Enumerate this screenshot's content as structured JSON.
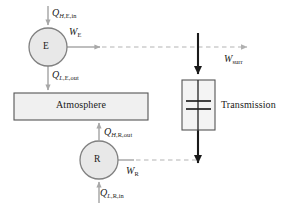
{
  "diagram": {
    "type": "thermodynamic-cycle-schematic",
    "width": 291,
    "height": 211,
    "background_color": "#ffffff",
    "colors": {
      "node_fill": "#e8e8e8",
      "node_stroke": "#808080",
      "box_fill": "#f0f0f0",
      "box_stroke": "#555555",
      "gray_arrow": "#a8a8a8",
      "dashed_line": "#b4b4b4",
      "black_shaft": "#1a1a1a",
      "text": "#1a1a1a"
    },
    "nodes": [
      {
        "id": "engine",
        "label": "E",
        "shape": "circle",
        "cx": 48,
        "cy": 47,
        "r": 19
      },
      {
        "id": "refrigerator",
        "label": "R",
        "shape": "circle",
        "cx": 99,
        "cy": 160,
        "r": 19
      }
    ],
    "boxes": [
      {
        "id": "atmosphere",
        "label": "Atmosphere",
        "x": 14,
        "y": 93,
        "width": 134,
        "height": 27
      },
      {
        "id": "transmission",
        "label": "Transmission",
        "x": 182,
        "y": 80,
        "width": 33,
        "height": 50
      }
    ],
    "labels": {
      "q_h_e_in": {
        "symbol": "Q",
        "sub_italic": "H",
        "sub_rest": ",E,in",
        "full": "Q_H,E,in"
      },
      "w_e": {
        "symbol": "W",
        "sub_italic": "",
        "sub_rest": "E",
        "full": "W_E"
      },
      "q_l_e_out": {
        "symbol": "Q",
        "sub_italic": "L",
        "sub_rest": ",E,out",
        "full": "Q_L,E,out"
      },
      "q_h_r_out": {
        "symbol": "Q",
        "sub_italic": "H",
        "sub_rest": ",R,out",
        "full": "Q_H,R,out"
      },
      "w_r": {
        "symbol": "W",
        "sub_italic": "",
        "sub_rest": "R",
        "full": "W_R"
      },
      "q_l_r_in": {
        "symbol": "Q",
        "sub_italic": "L",
        "sub_rest": ",R,in",
        "full": "Q_L,R,in"
      },
      "w_surr": {
        "symbol": "W",
        "sub_italic": "",
        "sub_rest": "surr",
        "full": "W_surr"
      }
    },
    "flows": [
      {
        "id": "heat-in-engine",
        "from": "ambient-top",
        "to": "engine",
        "style": "solid-gray",
        "direction": "down"
      },
      {
        "id": "work-out-engine",
        "from": "engine",
        "to": "transmission",
        "style": "solid-then-dashed-gray",
        "direction": "right"
      },
      {
        "id": "heat-out-engine",
        "from": "engine",
        "to": "atmosphere",
        "style": "solid-gray",
        "direction": "down"
      },
      {
        "id": "heat-out-refrigerator",
        "from": "refrigerator",
        "to": "atmosphere",
        "style": "solid-gray",
        "direction": "up"
      },
      {
        "id": "work-in-refrigerator",
        "from": "refrigerator",
        "to": "transmission",
        "style": "solid-then-dashed-gray",
        "direction": "right"
      },
      {
        "id": "heat-in-refrigerator",
        "from": "ambient-bottom",
        "to": "refrigerator",
        "style": "solid-gray",
        "direction": "up"
      },
      {
        "id": "shaft-into-transmission",
        "style": "thick-black",
        "direction": "down"
      },
      {
        "id": "shaft-out-transmission",
        "style": "thick-black",
        "direction": "down"
      }
    ]
  }
}
